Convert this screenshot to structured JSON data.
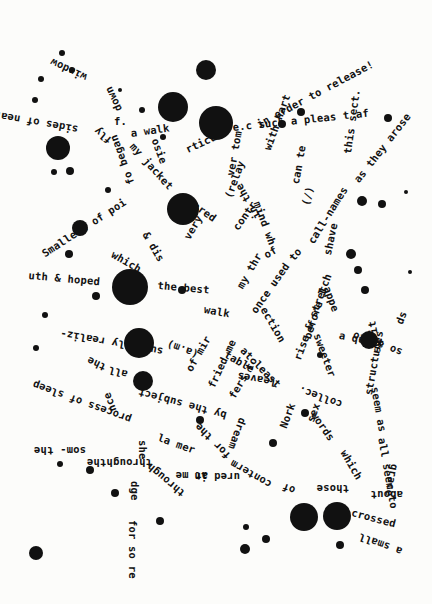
{
  "poem": {
    "ink_color": "#111111",
    "paper_color": "#fcfcfa",
    "fragments": [
      {
        "text": "in order to release!",
        "x": 255,
        "y": 120,
        "rot": -28
      },
      {
        "text": "e.c such a pleas t af",
        "x": 232,
        "y": 122,
        "rot": -6
      },
      {
        "text": "this sect.",
        "x": 342,
        "y": 153,
        "rot": -82
      },
      {
        "text": "as they arose",
        "x": 352,
        "y": 178,
        "rot": -52
      },
      {
        "text": "a walk",
        "x": 130,
        "y": 128,
        "rot": -8
      },
      {
        "text": "f.",
        "x": 114,
        "y": 116,
        "rot": 0
      },
      {
        "text": "window",
        "x": 84,
        "y": 83,
        "rot": 205
      },
      {
        "text": "sides of near",
        "x": 77,
        "y": 135,
        "rot": 190
      },
      {
        "text": "down",
        "x": 114,
        "y": 113,
        "rot": 245
      },
      {
        "text": "fly",
        "x": 107,
        "y": 146,
        "rot": 220
      },
      {
        "text": "osie",
        "x": 160,
        "y": 137,
        "rot": 70
      },
      {
        "text": "my jacket",
        "x": 136,
        "y": 141,
        "rot": 48
      },
      {
        "text": "rticu",
        "x": 184,
        "y": 145,
        "rot": -25
      },
      {
        "text": "fo began",
        "x": 126,
        "y": 186,
        "rot": 250
      },
      {
        "text": "Smallest of poi",
        "x": 40,
        "y": 250,
        "rot": -33
      },
      {
        "text": "uth & hoped",
        "x": 29,
        "y": 270,
        "rot": 5
      },
      {
        "text": "which",
        "x": 115,
        "y": 249,
        "rot": 30
      },
      {
        "text": "& dis",
        "x": 150,
        "y": 230,
        "rot": 60
      },
      {
        "text": "very",
        "x": 182,
        "y": 236,
        "rot": -60
      },
      {
        "text": "the best",
        "x": 158,
        "y": 280,
        "rot": 5
      },
      {
        "text": "ared",
        "x": 197,
        "y": 200,
        "rot": 35
      },
      {
        "text": "ver tom",
        "x": 225,
        "y": 175,
        "rot": 280
      },
      {
        "text": "(relay",
        "x": 223,
        "y": 196,
        "rot": -70
      },
      {
        "text": "with hart",
        "x": 262,
        "y": 148,
        "rot": -70
      },
      {
        "text": "contr",
        "x": 231,
        "y": 226,
        "rot": -55
      },
      {
        "text": "in the",
        "x": 253,
        "y": 221,
        "rot": 240
      },
      {
        "text": "mind wh",
        "x": 262,
        "y": 200,
        "rot": 70
      },
      {
        "text": "can te",
        "x": 290,
        "y": 183,
        "rot": -80
      },
      {
        "text": "(/)",
        "x": 300,
        "y": 204,
        "rot": -75
      },
      {
        "text": "call-names",
        "x": 306,
        "y": 240,
        "rot": -58
      },
      {
        "text": "shave",
        "x": 322,
        "y": 254,
        "rot": -78
      },
      {
        "text": "to",
        "x": 287,
        "y": 256,
        "rot": -50
      },
      {
        "text": "of",
        "x": 262,
        "y": 251,
        "rot": -30
      },
      {
        "text": "my thr",
        "x": 235,
        "y": 285,
        "rot": -60
      },
      {
        "text": "once used",
        "x": 249,
        "y": 309,
        "rot": -55
      },
      {
        "text": "walk",
        "x": 205,
        "y": 304,
        "rot": 10
      },
      {
        "text": "ection",
        "x": 268,
        "y": 305,
        "rot": 60
      },
      {
        "text": "rise & stretch",
        "x": 292,
        "y": 358,
        "rot": -70
      },
      {
        "text": "before I",
        "x": 302,
        "y": 337,
        "rot": -72
      },
      {
        "text": "appe",
        "x": 332,
        "y": 285,
        "rot": 70
      },
      {
        "text": "a quiet",
        "x": 340,
        "y": 330,
        "rot": 10
      },
      {
        "text": "ds",
        "x": 394,
        "y": 322,
        "rot": -70
      },
      {
        "text": "so as to",
        "x": 400,
        "y": 358,
        "rot": 200
      },
      {
        "text": "so it",
        "x": 372,
        "y": 354,
        "rot": 260
      },
      {
        "text": "sweeter",
        "x": 322,
        "y": 332,
        "rot": 70
      },
      {
        "text": "structures",
        "x": 363,
        "y": 394,
        "rot": -80
      },
      {
        "text": "seem as",
        "x": 380,
        "y": 386,
        "rot": 80
      },
      {
        "text": "all seem to",
        "x": 387,
        "y": 437,
        "rot": 80
      },
      {
        "text": "words",
        "x": 318,
        "y": 410,
        "rot": 55
      },
      {
        "text": "which",
        "x": 348,
        "y": 448,
        "rot": 60
      },
      {
        "text": "sex",
        "x": 305,
        "y": 420,
        "rot": -70
      },
      {
        "text": "collec.",
        "x": 340,
        "y": 410,
        "rot": 200
      },
      {
        "text": "Nork",
        "x": 278,
        "y": 426,
        "rot": -70
      },
      {
        "text": "dream",
        "x": 248,
        "y": 420,
        "rot": 110
      },
      {
        "text": "leaves",
        "x": 275,
        "y": 388,
        "rot": 190
      },
      {
        "text": "at least",
        "x": 246,
        "y": 345,
        "rot": 45
      },
      {
        "text": "table",
        "x": 228,
        "y": 349,
        "rot": 30
      },
      {
        "text": "of mir",
        "x": 184,
        "y": 368,
        "rot": -60
      },
      {
        "text": "fried me",
        "x": 206,
        "y": 385,
        "rot": -65
      },
      {
        "text": "fers to",
        "x": 227,
        "y": 395,
        "rot": -60
      },
      {
        "text": "suddenly realiz-",
        "x": 162,
        "y": 357,
        "rot": 190
      },
      {
        "text": "the",
        "x": 103,
        "y": 373,
        "rot": 205
      },
      {
        "text": "all",
        "x": 126,
        "y": 380,
        "rot": 195
      },
      {
        "text": "(a.m)",
        "x": 196,
        "y": 360,
        "rot": 200
      },
      {
        "text": "by the subject",
        "x": 225,
        "y": 421,
        "rot": 195
      },
      {
        "text": "process of sleep",
        "x": 129,
        "y": 425,
        "rot": 200
      },
      {
        "text": "nce",
        "x": 108,
        "y": 413,
        "rot": 250
      },
      {
        "text": "she",
        "x": 148,
        "y": 440,
        "rot": 90
      },
      {
        "text": "la mer",
        "x": 160,
        "y": 432,
        "rot": 20
      },
      {
        "text": "for the",
        "x": 225,
        "y": 461,
        "rot": 225
      },
      {
        "text": "som- the",
        "x": 86,
        "y": 456,
        "rot": 180
      },
      {
        "text": "throughthe",
        "x": 152,
        "y": 468,
        "rot": 180
      },
      {
        "text": "at me",
        "x": 208,
        "y": 481,
        "rot": 180
      },
      {
        "text": "conterm",
        "x": 268,
        "y": 490,
        "rot": 210
      },
      {
        "text": "ured in",
        "x": 240,
        "y": 482,
        "rot": 180
      },
      {
        "text": "of",
        "x": 293,
        "y": 496,
        "rot": 200
      },
      {
        "text": "those",
        "x": 349,
        "y": 494,
        "rot": 180
      },
      {
        "text": "about",
        "x": 403,
        "y": 500,
        "rot": 180
      },
      {
        "text": "grace",
        "x": 400,
        "y": 465,
        "rot": 100
      },
      {
        "text": "crossed",
        "x": 353,
        "y": 507,
        "rot": 15
      },
      {
        "text": "a small",
        "x": 400,
        "y": 557,
        "rot": 200
      },
      {
        "text": "through",
        "x": 180,
        "y": 499,
        "rot": 220
      },
      {
        "text": "dge",
        "x": 140,
        "y": 481,
        "rot": 90
      },
      {
        "text": "for so re",
        "x": 138,
        "y": 520,
        "rot": 90
      }
    ],
    "blots": [
      {
        "x": 206,
        "y": 70,
        "r": 10
      },
      {
        "x": 173,
        "y": 107,
        "r": 15
      },
      {
        "x": 216,
        "y": 123,
        "r": 17
      },
      {
        "x": 58,
        "y": 148,
        "r": 12
      },
      {
        "x": 183,
        "y": 209,
        "r": 16
      },
      {
        "x": 130,
        "y": 287,
        "r": 18
      },
      {
        "x": 80,
        "y": 228,
        "r": 8
      },
      {
        "x": 139,
        "y": 343,
        "r": 15
      },
      {
        "x": 143,
        "y": 381,
        "r": 10
      },
      {
        "x": 369,
        "y": 340,
        "r": 9
      },
      {
        "x": 304,
        "y": 517,
        "r": 14
      },
      {
        "x": 337,
        "y": 516,
        "r": 14
      },
      {
        "x": 36,
        "y": 553,
        "r": 7
      },
      {
        "x": 245,
        "y": 549,
        "r": 5
      },
      {
        "x": 362,
        "y": 201,
        "r": 5
      },
      {
        "x": 388,
        "y": 118,
        "r": 4
      },
      {
        "x": 301,
        "y": 112,
        "r": 4
      },
      {
        "x": 282,
        "y": 124,
        "r": 4
      },
      {
        "x": 72,
        "y": 70,
        "r": 3
      },
      {
        "x": 41,
        "y": 79,
        "r": 3
      },
      {
        "x": 62,
        "y": 53,
        "r": 3
      },
      {
        "x": 35,
        "y": 100,
        "r": 3
      },
      {
        "x": 120,
        "y": 90,
        "r": 2
      },
      {
        "x": 142,
        "y": 110,
        "r": 3
      },
      {
        "x": 163,
        "y": 137,
        "r": 3
      },
      {
        "x": 70,
        "y": 171,
        "r": 4
      },
      {
        "x": 54,
        "y": 172,
        "r": 3
      },
      {
        "x": 108,
        "y": 190,
        "r": 3
      },
      {
        "x": 69,
        "y": 254,
        "r": 4
      },
      {
        "x": 96,
        "y": 296,
        "r": 4
      },
      {
        "x": 45,
        "y": 315,
        "r": 3
      },
      {
        "x": 36,
        "y": 348,
        "r": 3
      },
      {
        "x": 182,
        "y": 290,
        "r": 4
      },
      {
        "x": 320,
        "y": 355,
        "r": 3
      },
      {
        "x": 351,
        "y": 254,
        "r": 5
      },
      {
        "x": 358,
        "y": 270,
        "r": 4
      },
      {
        "x": 365,
        "y": 290,
        "r": 4
      },
      {
        "x": 382,
        "y": 204,
        "r": 4
      },
      {
        "x": 406,
        "y": 192,
        "r": 2
      },
      {
        "x": 410,
        "y": 272,
        "r": 2
      },
      {
        "x": 305,
        "y": 413,
        "r": 4
      },
      {
        "x": 273,
        "y": 443,
        "r": 4
      },
      {
        "x": 200,
        "y": 420,
        "r": 4
      },
      {
        "x": 160,
        "y": 521,
        "r": 4
      },
      {
        "x": 115,
        "y": 493,
        "r": 4
      },
      {
        "x": 266,
        "y": 539,
        "r": 4
      },
      {
        "x": 340,
        "y": 545,
        "r": 4
      },
      {
        "x": 246,
        "y": 527,
        "r": 3
      },
      {
        "x": 90,
        "y": 470,
        "r": 4
      },
      {
        "x": 60,
        "y": 464,
        "r": 3
      }
    ]
  }
}
